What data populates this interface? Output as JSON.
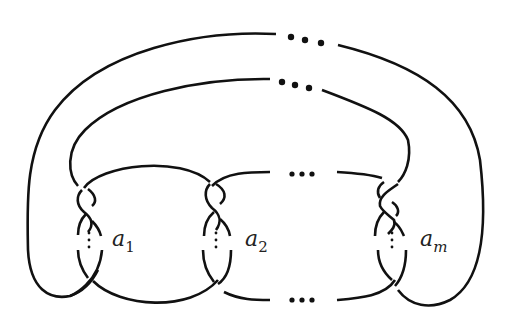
{
  "diagram": {
    "type": "knot-diagram",
    "twist_regions": [
      {
        "label": "a",
        "subscript": "1"
      },
      {
        "label": "a",
        "subscript": "2"
      },
      {
        "label": "a",
        "subscript": "m"
      }
    ],
    "ellipsis_glyph": "•••",
    "vertical_ellipsis": "⋮",
    "stroke_color": "#111111",
    "background": "#ffffff"
  }
}
